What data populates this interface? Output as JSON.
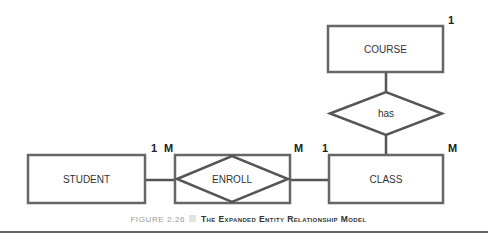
{
  "diagram": {
    "type": "entity-relationship",
    "entities": [
      {
        "id": "student",
        "label": "STUDENT"
      },
      {
        "id": "class",
        "label": "CLASS"
      },
      {
        "id": "course",
        "label": "COURSE"
      }
    ],
    "relationships": [
      {
        "id": "enroll",
        "label": "ENROLL",
        "associative": true
      },
      {
        "id": "has",
        "label": "has"
      }
    ],
    "cardinalities": {
      "student_enroll_left": "1",
      "student_enroll_right": "M",
      "enroll_class_left": "M",
      "enroll_class_right": "1",
      "class_top_right": "M",
      "course_top_right": "1"
    },
    "connections": [
      {
        "from": "student",
        "to": "enroll"
      },
      {
        "from": "enroll",
        "to": "class"
      },
      {
        "from": "course",
        "to": "has"
      },
      {
        "from": "has",
        "to": "class"
      }
    ]
  },
  "caption": {
    "number": "FIGURE 2.26",
    "title": "The Expanded Entity Relationship Model"
  },
  "colors": {
    "line": "#555555",
    "text": "#222222",
    "caption_number": "#999999",
    "caption_square": "#e3e3e3",
    "rule": "#333333"
  }
}
